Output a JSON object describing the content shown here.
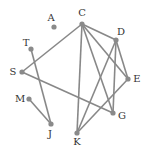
{
  "graph": {
    "nodes": [
      {
        "id": "A",
        "x": 54,
        "y": 27,
        "lx": 51,
        "ly": 18
      },
      {
        "id": "C",
        "x": 82,
        "y": 24,
        "lx": 82,
        "ly": 13
      },
      {
        "id": "D",
        "x": 116,
        "y": 40,
        "lx": 121,
        "ly": 32
      },
      {
        "id": "T",
        "x": 31,
        "y": 49,
        "lx": 26,
        "ly": 43
      },
      {
        "id": "S",
        "x": 22,
        "y": 72,
        "lx": 13,
        "ly": 72
      },
      {
        "id": "E",
        "x": 128,
        "y": 79,
        "lx": 137,
        "ly": 79
      },
      {
        "id": "M",
        "x": 29,
        "y": 99,
        "lx": 20,
        "ly": 99
      },
      {
        "id": "G",
        "x": 113,
        "y": 113,
        "lx": 122,
        "ly": 116
      },
      {
        "id": "J",
        "x": 51,
        "y": 124,
        "lx": 50,
        "ly": 134
      },
      {
        "id": "K",
        "x": 77,
        "y": 133,
        "lx": 77,
        "ly": 142
      }
    ],
    "edges": [
      [
        "C",
        "S"
      ],
      [
        "C",
        "D"
      ],
      [
        "C",
        "E"
      ],
      [
        "C",
        "K"
      ],
      [
        "C",
        "G"
      ],
      [
        "D",
        "E"
      ],
      [
        "D",
        "K"
      ],
      [
        "D",
        "G"
      ],
      [
        "E",
        "K"
      ],
      [
        "S",
        "G"
      ],
      [
        "T",
        "J"
      ],
      [
        "M",
        "J"
      ]
    ],
    "colors": {
      "edge": "#888888",
      "node": "#8a8a8a",
      "label": "#333333"
    }
  }
}
